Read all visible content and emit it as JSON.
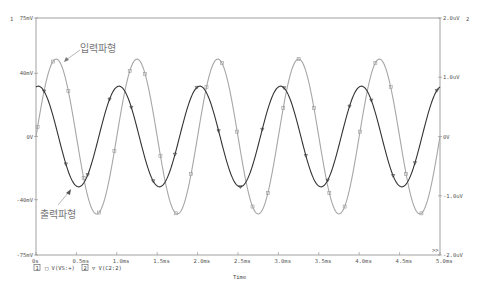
{
  "chart_data": {
    "type": "line",
    "title": "",
    "xlabel": "Time",
    "xlim": [
      0,
      5.0
    ],
    "x_unit": "ms",
    "x_ticks": [
      "0s",
      "0.5ms",
      "1.0ms",
      "1.5ms",
      "2.0ms",
      "2.5ms",
      "3.0ms",
      "3.5ms",
      "4.0ms",
      "4.5ms",
      "5.0ms"
    ],
    "y_axes": [
      {
        "id": "1",
        "side": "left",
        "ticks": [
          "75mV",
          "40mV",
          "0V",
          "-40mV",
          "-75mV"
        ],
        "ylim_mV": [
          -75,
          75
        ]
      },
      {
        "id": "2",
        "side": "right",
        "ticks": [
          "2.0uV",
          "1.0uV",
          "0V",
          "-1.0uV",
          "-2.0uV"
        ],
        "ylim_uV": [
          -2.0,
          2.0
        ]
      }
    ],
    "grid": false,
    "legend": [
      {
        "axis": "1",
        "marker": "square",
        "label": "V(VS:+)"
      },
      {
        "axis": "2",
        "marker": "triangle-down",
        "label": "V(C2:2)"
      }
    ],
    "series": [
      {
        "name": "V(VS:+)",
        "annotation": "입력파형",
        "axis": "1",
        "color": "#a0a0a0",
        "shape": "sine",
        "frequency_kHz": 1.0,
        "amplitude_mV": 49,
        "phase_deg": 0
      },
      {
        "name": "V(C2:2)",
        "annotation": "출력파형",
        "axis": "2",
        "color": "#303030",
        "shape": "sine",
        "frequency_kHz": 1.0,
        "amplitude_uV": 0.85,
        "phase_deg": 80
      }
    ],
    "annotations": [
      "입력파형",
      "출력파형"
    ]
  },
  "labels": {
    "axis1_id": "1",
    "axis2_id": "2",
    "xlabel": "Time",
    "input_annotation": "입력파형",
    "output_annotation": "출력파형",
    "legend1_num": "1",
    "legend1_text": "□ V(VS:+)",
    "legend2_num": "2",
    "legend2_text": "▽ V(C2:2)",
    "more": ">>"
  }
}
